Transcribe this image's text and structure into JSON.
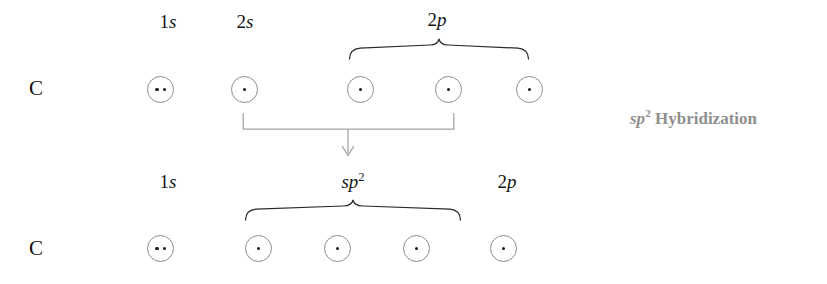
{
  "diagram": {
    "background_color": "#ffffff",
    "circle_stroke_color": "#8c8c8c",
    "electron_color": "#1a1a1a",
    "text_color": "#151515",
    "caption_color": "#8f8f8f",
    "arrow_color": "#9a9a9a"
  },
  "caption": {
    "base": "sp",
    "superscript": "2",
    "text": "Hybridization",
    "full": "sp2 Hybridization"
  },
  "rows": [
    {
      "id": "ground-state",
      "element": "C",
      "labels": [
        {
          "id": "1s",
          "num": "1",
          "letter": "s",
          "sup": "",
          "text": "1s"
        },
        {
          "id": "2s",
          "num": "2",
          "letter": "s",
          "sup": "",
          "text": "2s"
        },
        {
          "id": "2p",
          "num": "2",
          "letter": "p",
          "sup": "",
          "text": "2p"
        }
      ],
      "orbitals": [
        {
          "id": "1s",
          "subshell": "1s",
          "electrons": 2
        },
        {
          "id": "2s",
          "subshell": "2s",
          "electrons": 1
        },
        {
          "id": "2px",
          "subshell": "2p",
          "electrons": 1
        },
        {
          "id": "2py",
          "subshell": "2p",
          "electrons": 1
        },
        {
          "id": "2pz",
          "subshell": "2p",
          "electrons": 1
        }
      ]
    },
    {
      "id": "hybridized-state",
      "element": "C",
      "labels": [
        {
          "id": "1s",
          "num": "1",
          "letter": "s",
          "sup": "",
          "text": "1s"
        },
        {
          "id": "sp2",
          "num": "",
          "letter": "sp",
          "sup": "2",
          "text": "sp2"
        },
        {
          "id": "2p",
          "num": "2",
          "letter": "p",
          "sup": "",
          "text": "2p"
        }
      ],
      "orbitals": [
        {
          "id": "1s",
          "subshell": "1s",
          "electrons": 2
        },
        {
          "id": "sp2-a",
          "subshell": "sp2",
          "electrons": 1
        },
        {
          "id": "sp2-b",
          "subshell": "sp2",
          "electrons": 1
        },
        {
          "id": "sp2-c",
          "subshell": "sp2",
          "electrons": 1
        },
        {
          "id": "2p",
          "subshell": "2p",
          "electrons": 1
        }
      ]
    }
  ],
  "braces": [
    {
      "id": "brace-2p-top",
      "groups": "2p orbitals",
      "span_count": 3
    },
    {
      "id": "brace-sp2-bottom",
      "groups": "sp2 orbitals",
      "span_count": 3
    }
  ],
  "transition": {
    "id": "hybridization-arrow",
    "from": "2s and 2p orbitals",
    "to": "sp2 hybrid orbitals",
    "direction": "down"
  }
}
